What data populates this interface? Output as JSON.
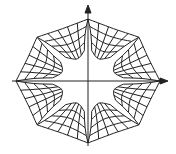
{
  "diagram": {
    "type": "octagonal curvilinear grid with coordinate axes",
    "stroke_color": "#222222",
    "background": "#ffffff",
    "axes": {
      "x_arrow": true,
      "y_arrow": true
    },
    "center": [
      88,
      81
    ],
    "sides": 8,
    "rings": 4,
    "radials_per_side": 5
  }
}
